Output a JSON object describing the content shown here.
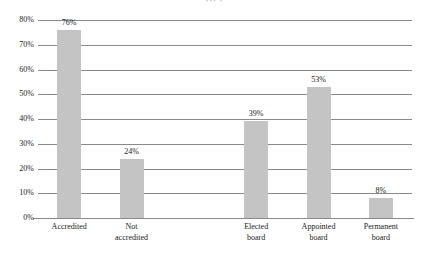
{
  "title_sliver": "··· ·",
  "chart_data": {
    "type": "bar",
    "title": "",
    "xlabel": "",
    "ylabel": "",
    "categories": [
      "Accredited",
      "Not accredited",
      "",
      "Elected board",
      "Appointed board",
      "Permanent board"
    ],
    "values": [
      76,
      24,
      null,
      39,
      53,
      8
    ],
    "value_labels": [
      "76%",
      "24%",
      "",
      "39%",
      "53%",
      "8%"
    ],
    "ylim": [
      0,
      80
    ],
    "ytick_values": [
      0,
      10,
      20,
      30,
      40,
      50,
      60,
      70,
      80
    ],
    "ytick_labels": [
      "0%",
      "10%",
      "20%",
      "30%",
      "40%",
      "50%",
      "60%",
      "70%",
      "80%"
    ],
    "grid": true,
    "legend": "none",
    "bar_color": "#c4c4c4",
    "gridline_color": "#8a8a8a",
    "axis_color": "#8a8a8a",
    "text_color": "#1a1a1a"
  }
}
